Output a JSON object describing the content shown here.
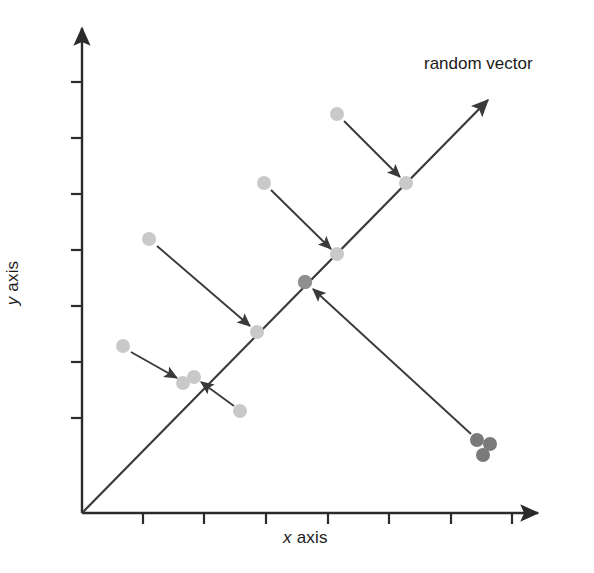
{
  "figure": {
    "width": 594,
    "height": 573,
    "background": "#ffffff"
  },
  "labels": {
    "x_axis_var": "x",
    "x_axis_text": " axis",
    "y_axis_var": "y",
    "y_axis_text": " axis",
    "annotation": "random vector"
  },
  "colors": {
    "axis": "#2b2b2b",
    "vector_line": "#3a3a3a",
    "arrow": "#3a3a3a",
    "point_light": "#c9c9c9",
    "point_mid": "#8f8f8f",
    "point_dark": "#7a7a7a",
    "text": "#1a1a1a"
  },
  "chart_data": {
    "type": "scatter",
    "title": "",
    "xlabel": "x axis",
    "ylabel": "y axis",
    "grid": false,
    "legend": null,
    "annotations": [
      {
        "text": "random vector",
        "x": 424,
        "y": 54,
        "describes": "principal-direction-arrow"
      }
    ],
    "axes": {
      "origin": [
        82,
        513
      ],
      "x_axis": {
        "from": [
          82,
          513
        ],
        "to": [
          538,
          513
        ],
        "arrowhead": true,
        "ticks_px": [
          143,
          204,
          266,
          328,
          389,
          451,
          512
        ],
        "tick_length": 11,
        "tick_labels": []
      },
      "y_axis": {
        "from": [
          82,
          513
        ],
        "to": [
          82,
          28
        ],
        "arrowhead": true,
        "ticks_px": [
          82,
          138,
          194,
          250,
          306,
          362,
          418
        ],
        "tick_length": 11,
        "tick_labels": []
      }
    },
    "vector_line": {
      "from": [
        82,
        513
      ],
      "to": [
        488,
        100
      ],
      "arrowhead": true,
      "label": "random vector"
    },
    "projections": [
      {
        "id": "p1",
        "data_point": [
          123,
          346
        ],
        "projected_point": [
          183,
          383
        ],
        "arrow_from": [
          131,
          352
        ],
        "arrow_to": [
          177,
          378
        ],
        "point_shade": "light"
      },
      {
        "id": "p2",
        "data_point": [
          240,
          411
        ],
        "projected_point": [
          194,
          377
        ],
        "arrow_from": [
          234,
          406
        ],
        "arrow_to": [
          201,
          382
        ],
        "point_shade": "light"
      },
      {
        "id": "p3",
        "data_point": [
          149,
          239
        ],
        "projected_point": [
          257,
          332
        ],
        "arrow_from": [
          157,
          246
        ],
        "arrow_to": [
          250,
          326
        ],
        "point_shade": "light"
      },
      {
        "id": "p4",
        "data_point": [
          264,
          183
        ],
        "projected_point": [
          337,
          254
        ],
        "arrow_from": [
          271,
          190
        ],
        "arrow_to": [
          331,
          249
        ],
        "point_shade": "light"
      },
      {
        "id": "p5",
        "data_point": [
          337,
          114
        ],
        "projected_point": [
          406,
          183
        ],
        "arrow_from": [
          344,
          121
        ],
        "arrow_to": [
          400,
          177
        ],
        "point_shade": "light"
      },
      {
        "id": "p6",
        "data_point": [
          477,
          440
        ],
        "projected_point": [
          305,
          282
        ],
        "arrow_from": [
          471,
          434
        ],
        "arrow_to": [
          313,
          289
        ],
        "point_shade": "dark"
      }
    ],
    "extra_points": [
      {
        "pos": [
          490,
          444
        ],
        "shade": "dark"
      },
      {
        "pos": [
          483,
          455
        ],
        "shade": "dark"
      },
      {
        "pos": [
          305,
          282
        ],
        "shade": "mid"
      }
    ],
    "point_radius": 7
  }
}
